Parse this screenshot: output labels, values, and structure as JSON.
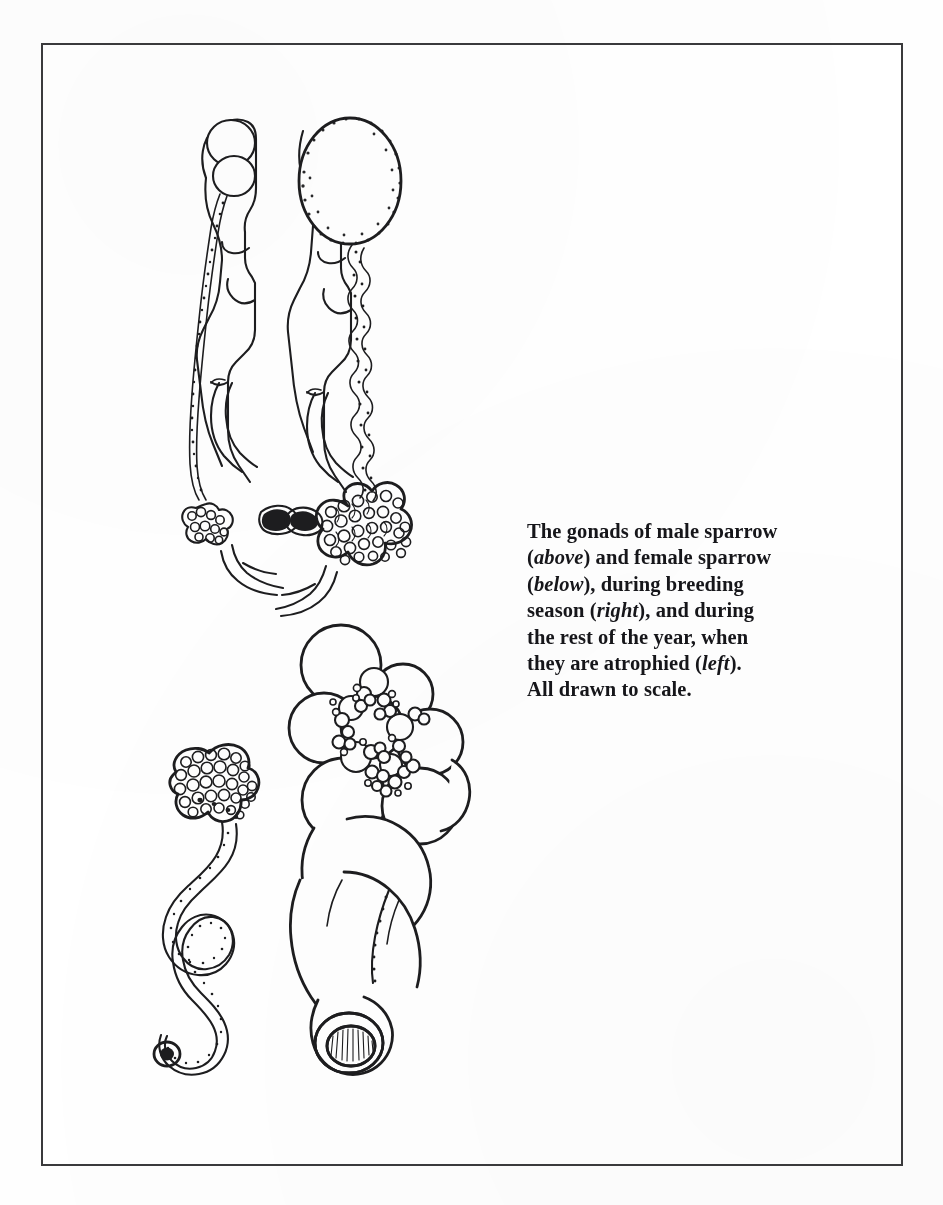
{
  "figure": {
    "kind": "scanned-book-illustration",
    "background_color": "#ffffff",
    "ink_color": "#1d1d1f",
    "frame": {
      "name": "figure-border",
      "color": "#3a3a3c",
      "stroke_width": 2,
      "x": 41,
      "y": 43,
      "width": 862,
      "height": 1123
    }
  },
  "caption": {
    "lines": [
      "The gonads of male sparrow",
      "(above) and female sparrow",
      "(below), during breeding",
      "season (right), and during",
      "the rest of the year, when",
      "they are atrophied (left).",
      "All drawn to scale."
    ],
    "line_1_a": "The gonads of male sparrow",
    "line_2_italic": "above",
    "line_2_b": ") and female sparrow",
    "line_3_italic": "below",
    "line_3_b": "), during breeding",
    "line_4_a": "season (",
    "line_4_italic": "right",
    "line_4_b": "), and during",
    "line_5": "the rest of the year, when",
    "line_6_a": "they are atrophied (",
    "line_6_italic": "left",
    "line_6_b": ").",
    "line_7": "All drawn to scale.",
    "full_text": "The gonads of male sparrow (above) and female sparrow (below), during breeding season (right), and during the rest of the year, when they are atrophied (left). All drawn to scale.",
    "text_color": "#16161a",
    "font_size_px": 20.5,
    "line_height_px": 26.4,
    "weight": "bold",
    "italic_terms": [
      "above",
      "below",
      "right",
      "left"
    ]
  },
  "panels": [
    {
      "id": "male-atrophied",
      "label": "male sparrow gonads, non-breeding (atrophied)",
      "sex": "male",
      "season": "rest of the year",
      "position": "upper-left",
      "parts": [
        "atrophied testes",
        "kidney",
        "vas deferens",
        "adrenal gland",
        "cloacal region"
      ],
      "testis_count": 2,
      "testis_size": "small"
    },
    {
      "id": "male-breeding",
      "label": "male sparrow gonads, breeding season",
      "sex": "male",
      "season": "breeding",
      "position": "upper-right",
      "parts": [
        "enlarged testis",
        "kidney",
        "convoluted vas deferens",
        "seminal glomus",
        "cloacal protuberance"
      ],
      "testis_count": 1,
      "testis_size": "greatly enlarged"
    },
    {
      "id": "female-atrophied",
      "label": "female sparrow gonads, non-breeding (atrophied)",
      "sex": "female",
      "season": "rest of the year",
      "position": "lower-left",
      "parts": [
        "atrophied ovary with small follicles",
        "thin convoluted oviduct",
        "cloacal opening"
      ],
      "follicle_size": "minute"
    },
    {
      "id": "female-breeding",
      "label": "female sparrow gonads, breeding season",
      "sex": "female",
      "season": "breeding",
      "position": "lower-right",
      "parts": [
        "ovary with large yolky ova",
        "enlarged oviduct",
        "shell gland",
        "cloacal opening"
      ],
      "follicle_size": "large mature ova"
    }
  ]
}
